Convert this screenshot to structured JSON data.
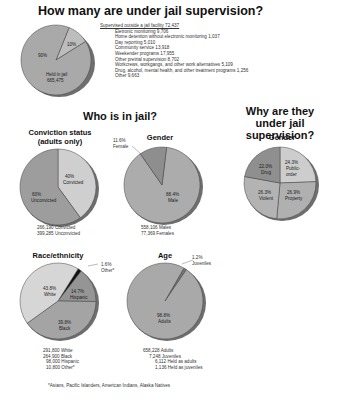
{
  "titles": {
    "main": "How many are under jail supervision?",
    "who": "Who is in jail?",
    "why": "Why are they under jail supervision?"
  },
  "colors": {
    "held": "#a9a9a9",
    "outside": "#bdbdbd",
    "convicted": "#cfcfcf",
    "unconvicted": "#9d9d9d",
    "male": "#acacac",
    "female": "#8e8e8e",
    "drug": "#8f8f8f",
    "public_order": "#cdcdcd",
    "violent": "#b3b3b3",
    "property": "#b0b0b0",
    "white": "#d6d6d6",
    "black": "#a4a4a4",
    "hispanic": "#959595",
    "other": "#111111",
    "adults": "#a9a9a9",
    "juveniles": "#777777",
    "shadow": "#6e6e6e",
    "stroke": "#444444"
  },
  "supervision_list": {
    "header": "Supervised outside a jail facility 72,437",
    "items": [
      "Eletronic monitoring 9,706",
      "Home detention without electronic monitoring 1,037",
      "Day reporting 5,010",
      "Community service 13,918",
      "Weekender programs 17,955",
      "Other pretrial supervision 8,702",
      "Workcrews, workgangs, and other work alternatives 5,109",
      "Drug, alcohol, mental health, and other treatment programs 1,256",
      "Other 9,663"
    ]
  },
  "chart_data": [
    {
      "type": "pie",
      "title": "How many are under jail supervision?",
      "categories": [
        "Held in jail",
        "Supervised outside a jail facility"
      ],
      "values": [
        90,
        10
      ],
      "labels": [
        "90%",
        "10%"
      ],
      "annotation": "Held in jail 665,475",
      "breakdown": {
        "Supervised outside a jail facility": 72437,
        "Eletronic monitoring": 9706,
        "Home detention without electronic monitoring": 1037,
        "Day reporting": 5010,
        "Community service": 13918,
        "Weekender programs": 17955,
        "Other pretrial supervision": 8702,
        "Workcrews, workgangs, and other work alternatives": 5109,
        "Drug, alcohol, mental health, and other treatment programs": 1256,
        "Other": 9663
      }
    },
    {
      "type": "pie",
      "title": "Conviction status (adults only)",
      "categories": [
        "Convicted",
        "Unconvicted"
      ],
      "values": [
        40,
        60
      ],
      "labels": [
        "40% Convicted",
        "60% Unconvicted"
      ],
      "counts": [
        "266,190 Convicted",
        "399,285 Unconvicted"
      ]
    },
    {
      "type": "pie",
      "title": "Gender",
      "categories": [
        "Male",
        "Female"
      ],
      "values": [
        88.4,
        11.6
      ],
      "labels": [
        "88.4% Male",
        "11.6% Female"
      ],
      "counts": [
        "558,106 Males",
        "77,369 Females"
      ]
    },
    {
      "type": "pie",
      "title": "Gender",
      "section": "Why are they under jail supervision?",
      "categories": [
        "Drug",
        "Public-order",
        "Property",
        "Violent"
      ],
      "values": [
        22.0,
        24.3,
        26.9,
        26.3
      ],
      "labels": [
        "22.0% Drug",
        "24.3% Public-order",
        "26.9% Property",
        "26.3% Violent"
      ]
    },
    {
      "type": "pie",
      "title": "Race/ethnicity",
      "categories": [
        "Other*",
        "Hispanic",
        "Black",
        "White"
      ],
      "values": [
        1.6,
        14.7,
        39.8,
        43.8
      ],
      "labels": [
        "1.6% Other*",
        "14.7% Hispanic",
        "39.8% Black",
        "43.8% White"
      ],
      "counts": [
        "291,800 White",
        "264,900 Black",
        "98,000 Hispanic",
        "10,800 Other*"
      ],
      "footnote": "*Asians, Pacific Islanders, American Indians, Alaska Natives"
    },
    {
      "type": "pie",
      "title": "Age",
      "categories": [
        "Juveniles",
        "Adults"
      ],
      "values": [
        1.2,
        98.8
      ],
      "labels": [
        "1.2% Juveniles",
        "98.8% Adults"
      ],
      "counts": [
        "658,228 Adults",
        "7,248 Juveniles",
        "6,112 Held as adults",
        "1,136 Held as juveniles"
      ]
    }
  ],
  "pies": {
    "main": {
      "held_pct": "90%",
      "outside_pct": "10%",
      "held_label": "Held in jail",
      "held_count": "665,475"
    },
    "conviction": {
      "title_line1": "Conviction status",
      "title_line2": "(adults only)",
      "convicted_pct": "40%",
      "convicted": "Convicted",
      "unconvicted_pct": "60%",
      "unconvicted": "Unconvicted",
      "count1": "266,190 Convicted",
      "count2": "399,285 Unconvicted"
    },
    "gender": {
      "title": "Gender",
      "female_pct": "11.6%",
      "female": "Female",
      "male_pct": "88.4%",
      "male": "Male",
      "count1": "558,106 Males",
      "count2": "77,369 Females"
    },
    "offense": {
      "title": "Gender",
      "drug_pct": "22.0%",
      "drug": "Drug",
      "public_pct": "24.3%",
      "public1": "Public-",
      "public2": "order",
      "violent_pct": "26.3%",
      "violent": "Violent",
      "property_pct": "26.9%",
      "property": "Property"
    },
    "race": {
      "title": "Race/ethnicity",
      "other_pct": "1.6%",
      "other": "Other*",
      "white_pct": "43.8%",
      "white": "White",
      "hispanic_pct": "14.7%",
      "hispanic": "Hispanic",
      "black_pct": "39.8%",
      "black": "Black",
      "count1": "291,800 White",
      "count2": "264,900 Black",
      "count3": "98,000 Hispanic",
      "count4": "10,800 Other*"
    },
    "age": {
      "title": "Age",
      "juv_pct": "1.2%",
      "juv": "Juveniles",
      "adult_pct": "98.8%",
      "adult": "Adults",
      "count1": "658,228 Adults",
      "count2": "7,248 Juveniles",
      "count3": "6,112 Held as adults",
      "count4": "1,136 Held as juveniles"
    }
  },
  "footnote": "*Asians, Pacific Islanders, American Indians, Alaska Natives"
}
